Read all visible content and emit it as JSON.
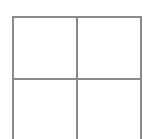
{
  "diagram": {
    "type": "grid",
    "rows": 2,
    "columns": 2,
    "line_color": "#8a8a8a",
    "background": "#ffffff",
    "cells": [
      {
        "row": 0,
        "col": 0,
        "text": ""
      },
      {
        "row": 0,
        "col": 1,
        "text": ""
      },
      {
        "row": 1,
        "col": 0,
        "text": ""
      },
      {
        "row": 1,
        "col": 1,
        "text": ""
      }
    ]
  }
}
